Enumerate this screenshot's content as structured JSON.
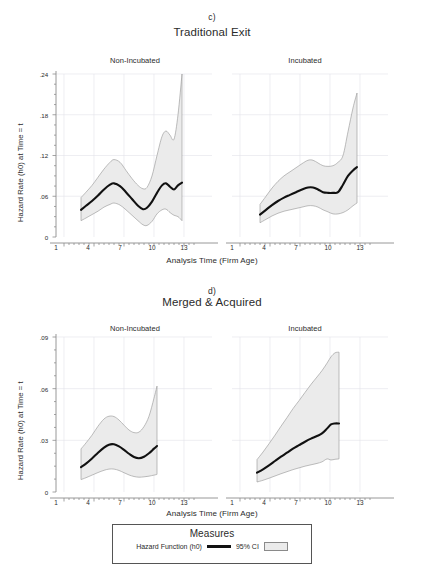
{
  "figure": {
    "background": "#ffffff",
    "line_color": "#111111",
    "band_color": "#ebebeb",
    "band_edge_color": "#9a9a9a",
    "grid_color": "#e3e3ea",
    "axis_color": "#8d8d8d"
  },
  "panels": [
    {
      "letter": "c)",
      "title": "Traditional Exit",
      "subpanels": [
        {
          "header": "Non-Incubated"
        },
        {
          "header": "Incubated"
        }
      ],
      "ylabel": "Hazard Rate (h0) at Time = t",
      "xlabel": "Analysis Time (Firm Age)",
      "yticks": [
        "0",
        ".06",
        ".12",
        ".18",
        ".24"
      ],
      "xticks": [
        "1",
        "4",
        "7",
        "10",
        "13"
      ]
    },
    {
      "letter": "d)",
      "title": "Merged & Acquired",
      "subpanels": [
        {
          "header": "Non-Incubated"
        },
        {
          "header": "Incubated"
        }
      ],
      "ylabel": "Hazard Rate (h0) at Time = t",
      "xlabel": "Analysis Time (Firm Age)",
      "yticks": [
        "0",
        ".03",
        ".06",
        ".09"
      ],
      "xticks": [
        "1",
        "4",
        "7",
        "10",
        "13"
      ]
    }
  ],
  "legend": {
    "title": "Measures",
    "line_label": "Hazard Function (h0)",
    "ci_label": "95% CI"
  },
  "chart_data": [
    {
      "id": "c-non-incubated",
      "type": "line",
      "title": "Traditional Exit — Non-Incubated",
      "panel_letter": "c)",
      "xlabel": "Analysis Time (Firm Age)",
      "ylabel": "Hazard Rate (h0) at Time = t",
      "xlim": [
        0.2,
        14.6
      ],
      "ylim": [
        0,
        0.24
      ],
      "xticks": [
        1,
        4,
        7,
        10,
        13
      ],
      "yticks": [
        0,
        0.06,
        0.12,
        0.18,
        0.24
      ],
      "grid": true,
      "legend_position": "bottom-outside",
      "series": [
        {
          "name": "Hazard Function (h0)",
          "x": [
            2.7,
            3.2,
            3.8,
            4.4,
            5.0,
            5.6,
            6.0,
            6.6,
            7.2,
            7.8,
            8.4,
            8.9,
            9.3,
            9.8,
            10.3,
            10.8,
            11.2,
            11.6,
            12.0,
            12.4,
            12.8
          ],
          "y": [
            0.04,
            0.046,
            0.053,
            0.061,
            0.07,
            0.077,
            0.079,
            0.075,
            0.066,
            0.056,
            0.046,
            0.041,
            0.043,
            0.052,
            0.065,
            0.076,
            0.079,
            0.074,
            0.07,
            0.076,
            0.08
          ]
        },
        {
          "name": "95% CI upper",
          "x": [
            2.7,
            3.2,
            3.8,
            4.4,
            5.0,
            5.6,
            6.0,
            6.6,
            7.2,
            7.8,
            8.4,
            8.9,
            9.3,
            9.8,
            10.3,
            10.8,
            11.2,
            11.6,
            12.0,
            12.4,
            12.8
          ],
          "y": [
            0.058,
            0.066,
            0.076,
            0.088,
            0.1,
            0.11,
            0.114,
            0.11,
            0.098,
            0.086,
            0.076,
            0.071,
            0.073,
            0.09,
            0.12,
            0.148,
            0.156,
            0.15,
            0.144,
            0.18,
            0.24
          ]
        },
        {
          "name": "95% CI lower",
          "x": [
            2.7,
            3.2,
            3.8,
            4.4,
            5.0,
            5.6,
            6.0,
            6.6,
            7.2,
            7.8,
            8.4,
            8.9,
            9.3,
            9.8,
            10.3,
            10.8,
            11.2,
            11.6,
            12.0,
            12.4,
            12.8
          ],
          "y": [
            0.024,
            0.028,
            0.033,
            0.038,
            0.044,
            0.048,
            0.05,
            0.047,
            0.04,
            0.032,
            0.024,
            0.018,
            0.017,
            0.023,
            0.034,
            0.04,
            0.041,
            0.036,
            0.032,
            0.03,
            0.024
          ]
        }
      ]
    },
    {
      "id": "c-incubated",
      "type": "line",
      "title": "Traditional Exit — Incubated",
      "panel_letter": "c)",
      "xlabel": "Analysis Time (Firm Age)",
      "ylabel": "Hazard Rate (h0) at Time = t",
      "xlim": [
        0.2,
        14.6
      ],
      "ylim": [
        0,
        0.24
      ],
      "xticks": [
        1,
        4,
        7,
        10,
        13
      ],
      "yticks": [
        0,
        0.06,
        0.12,
        0.18,
        0.24
      ],
      "grid": true,
      "series": [
        {
          "name": "Hazard Function (h0)",
          "x": [
            3.0,
            3.6,
            4.2,
            4.8,
            5.4,
            6.0,
            6.6,
            7.2,
            7.8,
            8.3,
            8.8,
            9.3,
            9.8,
            10.3,
            10.8,
            11.3,
            11.8,
            12.3,
            12.7
          ],
          "y": [
            0.033,
            0.04,
            0.047,
            0.053,
            0.058,
            0.062,
            0.066,
            0.07,
            0.073,
            0.073,
            0.07,
            0.066,
            0.065,
            0.065,
            0.066,
            0.077,
            0.09,
            0.098,
            0.103
          ]
        },
        {
          "name": "95% CI upper",
          "x": [
            3.0,
            3.6,
            4.2,
            4.8,
            5.4,
            6.0,
            6.6,
            7.2,
            7.8,
            8.3,
            8.8,
            9.3,
            9.8,
            10.3,
            10.8,
            11.3,
            11.8,
            12.3,
            12.7
          ],
          "y": [
            0.048,
            0.06,
            0.072,
            0.082,
            0.09,
            0.096,
            0.102,
            0.108,
            0.113,
            0.113,
            0.109,
            0.105,
            0.104,
            0.105,
            0.11,
            0.12,
            0.155,
            0.19,
            0.212
          ]
        },
        {
          "name": "95% CI lower",
          "x": [
            3.0,
            3.6,
            4.2,
            4.8,
            5.4,
            6.0,
            6.6,
            7.2,
            7.8,
            8.3,
            8.8,
            9.3,
            9.8,
            10.3,
            10.8,
            11.3,
            11.8,
            12.3,
            12.7
          ],
          "y": [
            0.021,
            0.026,
            0.031,
            0.035,
            0.038,
            0.04,
            0.042,
            0.044,
            0.046,
            0.046,
            0.044,
            0.04,
            0.037,
            0.034,
            0.034,
            0.036,
            0.04,
            0.046,
            0.05
          ]
        }
      ]
    },
    {
      "id": "d-non-incubated",
      "type": "line",
      "title": "Merged & Acquired — Non-Incubated",
      "panel_letter": "d)",
      "xlabel": "Analysis Time (Firm Age)",
      "ylabel": "Hazard Rate (h0) at Time = t",
      "xlim": [
        0.2,
        14.6
      ],
      "ylim": [
        0,
        0.09
      ],
      "xticks": [
        1,
        4,
        7,
        10,
        13
      ],
      "yticks": [
        0,
        0.03,
        0.06,
        0.09
      ],
      "grid": true,
      "series": [
        {
          "name": "Hazard Function (h0)",
          "x": [
            2.7,
            3.2,
            3.8,
            4.4,
            5.0,
            5.5,
            6.0,
            6.5,
            7.0,
            7.5,
            8.0,
            8.5,
            9.0,
            9.5,
            10.0,
            10.3
          ],
          "y": [
            0.0145,
            0.0165,
            0.0195,
            0.0228,
            0.0258,
            0.0275,
            0.0277,
            0.0265,
            0.0245,
            0.0222,
            0.0203,
            0.0196,
            0.0205,
            0.0225,
            0.0252,
            0.0267
          ]
        },
        {
          "name": "95% CI upper",
          "x": [
            2.7,
            3.2,
            3.8,
            4.4,
            5.0,
            5.5,
            6.0,
            6.5,
            7.0,
            7.5,
            8.0,
            8.5,
            9.0,
            9.5,
            10.0,
            10.3
          ],
          "y": [
            0.025,
            0.0285,
            0.033,
            0.0382,
            0.0424,
            0.044,
            0.0438,
            0.0418,
            0.0388,
            0.036,
            0.0345,
            0.0348,
            0.038,
            0.044,
            0.0545,
            0.0615
          ]
        },
        {
          "name": "95% CI lower",
          "x": [
            2.7,
            3.2,
            3.8,
            4.4,
            5.0,
            5.5,
            6.0,
            6.5,
            7.0,
            7.5,
            8.0,
            8.5,
            9.0,
            9.5,
            10.0,
            10.3
          ],
          "y": [
            0.0072,
            0.0083,
            0.0098,
            0.0113,
            0.0126,
            0.0133,
            0.0133,
            0.0125,
            0.0112,
            0.0099,
            0.009,
            0.0086,
            0.0088,
            0.0092,
            0.0098,
            0.0102
          ]
        }
      ]
    },
    {
      "id": "d-incubated",
      "type": "line",
      "title": "Merged & Acquired — Incubated",
      "panel_letter": "d)",
      "xlabel": "Analysis Time (Firm Age)",
      "ylabel": "Hazard Rate (h0) at Time = t",
      "xlim": [
        0.2,
        14.6
      ],
      "ylim": [
        0,
        0.09
      ],
      "xticks": [
        1,
        4,
        7,
        10,
        13
      ],
      "yticks": [
        0,
        0.03,
        0.06,
        0.09
      ],
      "grid": true,
      "series": [
        {
          "name": "Hazard Function (h0)",
          "x": [
            2.7,
            3.3,
            3.9,
            4.5,
            5.1,
            5.7,
            6.3,
            6.9,
            7.5,
            8.1,
            8.7,
            9.2,
            9.7,
            10.1,
            10.5,
            10.9
          ],
          "y": [
            0.0112,
            0.0132,
            0.0155,
            0.018,
            0.0205,
            0.0228,
            0.0252,
            0.0272,
            0.0292,
            0.031,
            0.0325,
            0.034,
            0.0368,
            0.0392,
            0.0398,
            0.0398
          ]
        },
        {
          "name": "95% CI upper",
          "x": [
            2.7,
            3.3,
            3.9,
            4.5,
            5.1,
            5.7,
            6.3,
            6.9,
            7.5,
            8.1,
            8.7,
            9.2,
            9.7,
            10.1,
            10.5,
            10.9
          ],
          "y": [
            0.0188,
            0.0232,
            0.028,
            0.033,
            0.0382,
            0.0432,
            0.0484,
            0.053,
            0.0578,
            0.0625,
            0.0668,
            0.0705,
            0.0748,
            0.0785,
            0.0808,
            0.0812
          ]
        },
        {
          "name": "95% CI lower",
          "x": [
            2.7,
            3.3,
            3.9,
            4.5,
            5.1,
            5.7,
            6.3,
            6.9,
            7.5,
            8.1,
            8.7,
            9.2,
            9.7,
            10.1,
            10.5,
            10.9
          ],
          "y": [
            0.0058,
            0.0068,
            0.008,
            0.0093,
            0.0106,
            0.0118,
            0.013,
            0.014,
            0.015,
            0.0158,
            0.0166,
            0.0175,
            0.0192,
            0.0186,
            0.019,
            0.0192
          ]
        }
      ]
    }
  ]
}
